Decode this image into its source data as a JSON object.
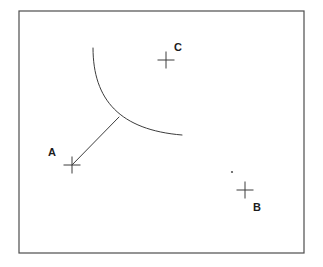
{
  "figure": {
    "title": "",
    "background_color": "#ffffff",
    "frame": {
      "name": "border-rectangle",
      "x": 19,
      "y": 11,
      "width": 285,
      "height": 242,
      "stroke_color": "#4d4d4d"
    },
    "stroke_color": "#3c3c3c",
    "label_color": "#1c1c1c"
  },
  "points": [
    {
      "id": "A",
      "label": "A",
      "marker": "cross",
      "cx": 72,
      "cy": 165,
      "size": 17,
      "label_x": 48,
      "label_y": 156
    },
    {
      "id": "B",
      "label": "B",
      "marker": "cross",
      "cx": 245,
      "cy": 190,
      "size": 17,
      "label_x": 253,
      "label_y": 211
    },
    {
      "id": "C",
      "label": "C",
      "marker": "cross",
      "cx": 166,
      "cy": 60,
      "size": 17,
      "label_x": 174,
      "label_y": 51
    }
  ],
  "dot": {
    "id": "unlabeled-dot",
    "cx": 232,
    "cy": 172,
    "r": 1.1
  },
  "arc": {
    "id": "curve-arc",
    "path": "M 93 48 C 93 100, 120 130, 182 135",
    "start_x": 93,
    "start_y": 48,
    "end_x": 182,
    "end_y": 135
  },
  "segment": {
    "id": "segment-a-to-arc",
    "x1": 72,
    "y1": 165,
    "x2": 119,
    "y2": 117
  }
}
